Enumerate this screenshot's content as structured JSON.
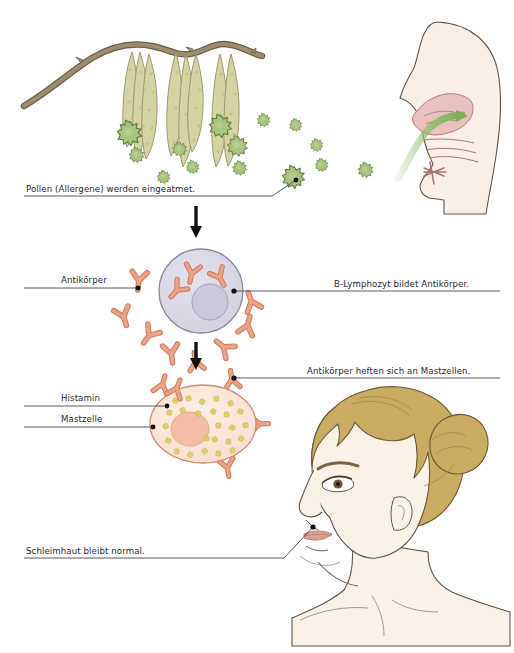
{
  "figure": {
    "title_partial": "",
    "background": "#ffffff",
    "language": "de"
  },
  "labels": {
    "pollen": "Pollen (Allergene) werden eingeatmet.",
    "antibody": "Antikörper",
    "lymphocyte": "B-Lymphozyt bildet Antikörper.",
    "attach": "Antikörper heften sich an Mastzellen.",
    "histamine": "Histamin",
    "mastcell": "Mastzelle",
    "mucosa": "Schleimhaut bleibt normal."
  },
  "colors": {
    "pollen_fill": "#a8c47e",
    "pollen_stroke": "#5f7a3e",
    "catkin_fill": "#d3d3a4",
    "catkin_stroke": "#8d8d5a",
    "branch_fill": "#9a8b6e",
    "branch_stroke": "#6b5d46",
    "skin_fill": "#f7ece2",
    "skin_stroke": "#5a5049",
    "nasal_fill": "#e7bfbd",
    "nasal_stroke": "#a36f6c",
    "arrow_green": "#7fae5a",
    "lymphocyte_fill": "#d8d5e4",
    "lymphocyte_stroke": "#8a8799",
    "nucleus_fill": "#cdcadc",
    "antibody_fill": "#eda185",
    "antibody_stroke": "#c97a5e",
    "mastcell_fill": "#fae3d6",
    "mastcell_stroke": "#c98a74",
    "mastcell_nucleus": "#f3bda6",
    "histamine_granule": "#ddd06a",
    "hair_fill": "#c9ab62",
    "hair_stroke": "#6b5a33",
    "face_fill": "#fbf1e6",
    "lips_fill": "#d9a08f",
    "leader_line": "#4a4a4a",
    "arrow_black": "#111111",
    "text": "#2b2b2b"
  },
  "steps": [
    {
      "index": 1,
      "name": "inhalation",
      "caption": "Pollen (Allergene) werden eingeatmet."
    },
    {
      "index": 2,
      "name": "antibody-production",
      "caption": "B-Lymphozyt bildet Antikörper."
    },
    {
      "index": 3,
      "name": "antibody-attachment",
      "caption": "Antikörper heften sich an Mastzellen."
    },
    {
      "index": 4,
      "name": "normal-mucosa",
      "caption": "Schleimhaut bleibt normal."
    }
  ],
  "arrows": {
    "flow_1_label": "down-arrow",
    "flow_2_label": "down-arrow",
    "inhale_label": "green-inhale-arrow"
  }
}
